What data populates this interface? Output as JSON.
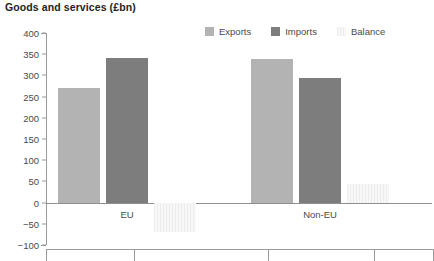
{
  "chart_data": {
    "type": "bar",
    "title": "Goods and services (£bn)",
    "xlabel": "",
    "ylabel": "",
    "categories": [
      "EU",
      "Non-EU"
    ],
    "series": [
      {
        "name": "Exports",
        "values": [
          270,
          338
        ],
        "color": "#b3b3b3"
      },
      {
        "name": "Imports",
        "values": [
          340,
          295
        ],
        "color": "#7d7d7d"
      },
      {
        "name": "Balance",
        "values": [
          -70,
          43
        ],
        "color": "#f1f1f1"
      }
    ],
    "ylim": [
      -100,
      400
    ],
    "ytick_step": 50,
    "yticks": [
      "400",
      "350",
      "300",
      "250",
      "200",
      "150",
      "100",
      "50",
      "0",
      "-50",
      "-100"
    ],
    "ytick_values": [
      400,
      350,
      300,
      250,
      200,
      150,
      100,
      50,
      0,
      -50,
      -100
    ],
    "grid": false,
    "legend_position": "top-right",
    "zero_line": 0
  },
  "legend": {
    "items": [
      {
        "label": "Exports",
        "color": "#b3b3b3"
      },
      {
        "label": "Imports",
        "color": "#7d7d7d"
      },
      {
        "label": "Balance",
        "color": "#f1f1f1"
      }
    ]
  },
  "colors": {
    "exports": "#b3b3b3",
    "imports": "#7d7d7d",
    "balance": "#f1f1f1",
    "axis": "#9a9a9a",
    "title_text": "#231f20",
    "tick_text": "#4a4a4a"
  }
}
